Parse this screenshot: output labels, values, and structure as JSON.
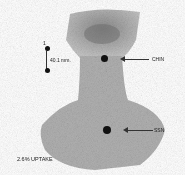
{
  "image": {
    "type": "thyroid scintigraphy (scan)",
    "background": "#ffffff",
    "uptake_color": "#9a9a9a"
  },
  "scale_marker": {
    "top_label": "1",
    "distance_label": "40.1 mm."
  },
  "markers": [
    {
      "label": "CHIN"
    },
    {
      "label": "SSN"
    }
  ],
  "footer": {
    "uptake_text": "2.6% UPTAKE"
  }
}
